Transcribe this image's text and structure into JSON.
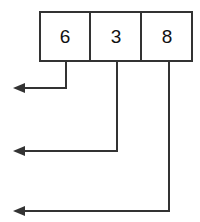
{
  "diagram": {
    "type": "array-with-pointer-arrows",
    "canvas": {
      "width": 200,
      "height": 222,
      "background": "#ffffff"
    },
    "style": {
      "line_color": "#333333",
      "box_fill": "#ffffff",
      "text_color": "#111111",
      "stroke_width": 2
    },
    "array": {
      "x": 39,
      "y": 11,
      "width": 154,
      "height": 51,
      "cell_width": 51,
      "cells": [
        {
          "label": "6",
          "index": 0,
          "center_x": 65,
          "center_y": 37
        },
        {
          "label": "3",
          "index": 1,
          "center_x": 116,
          "center_y": 37
        },
        {
          "label": "8",
          "index": 2,
          "center_x": 168,
          "center_y": 37
        }
      ]
    },
    "arrows": [
      {
        "name": "pointer-arrow-from-cell-0",
        "source_cell": "6",
        "drop_x": 66,
        "drop_from_y": 62,
        "turn_y": 88,
        "tip_x": 14,
        "points": "66,62 66,88 14,88"
      },
      {
        "name": "pointer-arrow-from-cell-1",
        "source_cell": "3",
        "drop_x": 117,
        "drop_from_y": 62,
        "turn_y": 151,
        "tip_x": 14,
        "points": "117,62 117,151 14,151"
      },
      {
        "name": "pointer-arrow-from-cell-2",
        "source_cell": "8",
        "drop_x": 169,
        "drop_from_y": 62,
        "turn_y": 211,
        "tip_x": 14,
        "points": "169,62 169,211 14,211"
      }
    ],
    "arrow_head": {
      "length": 11,
      "half_width": 5
    }
  }
}
